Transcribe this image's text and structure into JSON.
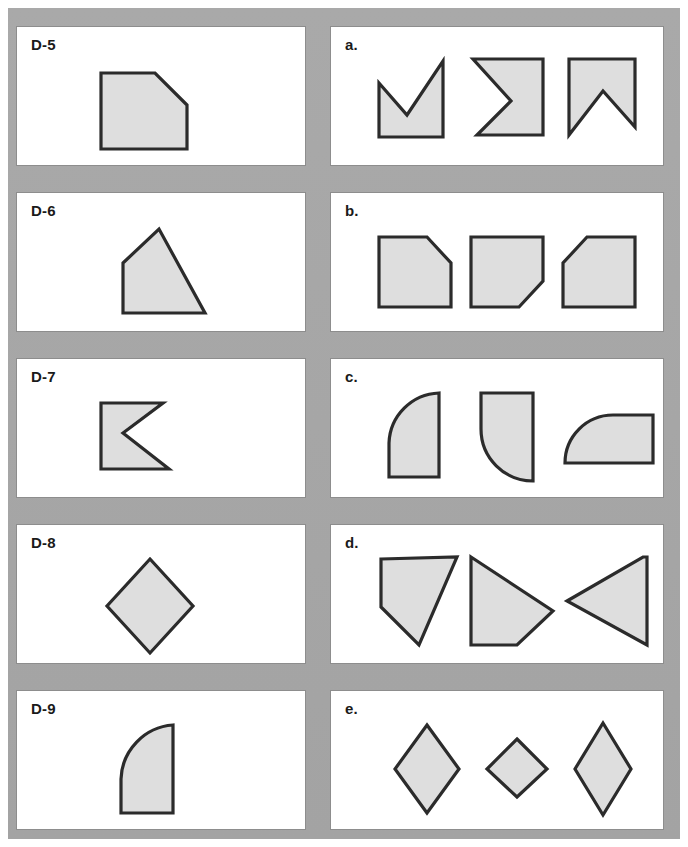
{
  "sheet": {
    "title": "Shape identification worksheet",
    "background_color": "#a8a8a8",
    "panel_color": "#ffffff",
    "shape_fill": "#dedede",
    "shape_stroke": "#2b2b2b"
  },
  "left_column": {
    "panels": [
      {
        "label": "D-5",
        "shape_name": "square-chamfered-top-right",
        "description": "square with cut (chamfered) top-right corner"
      },
      {
        "label": "D-6",
        "shape_name": "quadrilateral-house",
        "description": "four-sided figure with peak at top"
      },
      {
        "label": "D-7",
        "shape_name": "arrow-notched-right",
        "description": "concave arrow with V notch cut into right side"
      },
      {
        "label": "D-8",
        "shape_name": "diamond-tall",
        "description": "vertically elongated diamond / rhombus"
      },
      {
        "label": "D-9",
        "shape_name": "rounded-top-left-rectangle",
        "description": "rectangle with quarter-circle rounded top-left corner"
      }
    ]
  },
  "right_column": {
    "panels": [
      {
        "label": "a.",
        "shape_name": "row-notched-arrows",
        "choices": [
          {
            "name": "arrow-notch-top",
            "description": "notch opening upward"
          },
          {
            "name": "arrow-notch-left",
            "description": "notch opening to the left"
          },
          {
            "name": "arrow-notch-bottom",
            "description": "notch opening downward"
          }
        ]
      },
      {
        "label": "b.",
        "shape_name": "row-chamfered-squares",
        "choices": [
          {
            "name": "square-chamfer-top-right",
            "description": "cut top-right corner"
          },
          {
            "name": "square-chamfer-bottom-right",
            "description": "cut bottom-right corner"
          },
          {
            "name": "square-chamfer-top-left",
            "description": "cut top-left corner"
          }
        ]
      },
      {
        "label": "c.",
        "shape_name": "row-rounded-corner-shapes",
        "choices": [
          {
            "name": "rounded-top-left-tall",
            "description": "tall shape rounded top-left"
          },
          {
            "name": "rounded-bottom-left-concave",
            "description": "shape with concave bottom-left arc"
          },
          {
            "name": "rounded-top-left-wide",
            "description": "wide shape rounded top-left"
          }
        ]
      },
      {
        "label": "d.",
        "shape_name": "row-quadrilaterals",
        "choices": [
          {
            "name": "quadrilateral-rotated-a",
            "description": "quadrilateral point down-right"
          },
          {
            "name": "quadrilateral-rotated-b",
            "description": "quadrilateral point to right"
          },
          {
            "name": "quadrilateral-rotated-c",
            "description": "quadrilateral point to left"
          }
        ]
      },
      {
        "label": "e.",
        "shape_name": "row-diamonds",
        "choices": [
          {
            "name": "diamond-large",
            "description": "large diamond"
          },
          {
            "name": "diamond-wide-small",
            "description": "smaller wide diamond"
          },
          {
            "name": "diamond-tall",
            "description": "tall narrow diamond"
          }
        ]
      }
    ]
  }
}
